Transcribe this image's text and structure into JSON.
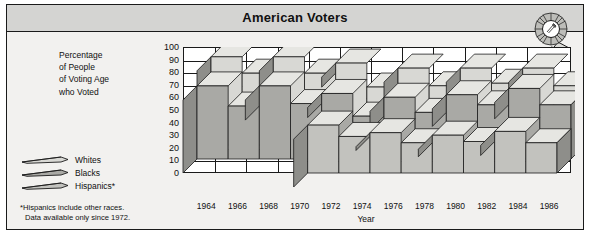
{
  "card": {
    "title": "American Voters",
    "award_icon": "award-rosette-icon"
  },
  "y_axis_caption": [
    "Percentage",
    "of People",
    "of Voting Age",
    "who Voted"
  ],
  "legend": {
    "items": [
      {
        "label": "Whites",
        "color": "#d8d8d4",
        "icon": "ribbon-swatch-icon"
      },
      {
        "label": "Blacks",
        "color": "#a9a9a5",
        "icon": "ribbon-swatch-icon"
      },
      {
        "label": "Hispanics*",
        "color": "#c2c2be",
        "icon": "ribbon-swatch-icon"
      }
    ]
  },
  "footnote": {
    "line1": "*Hispanics include other races.",
    "line2": "Data available only since 1972."
  },
  "chart_data": {
    "type": "area",
    "title": "American Voters",
    "xlabel": "Year",
    "ylabel": "Percentage of People of Voting Age who Voted",
    "categories": [
      1964,
      1966,
      1968,
      1970,
      1972,
      1974,
      1976,
      1978,
      1980,
      1982,
      1984,
      1986
    ],
    "ylim": [
      0,
      100
    ],
    "yticks": [
      0,
      10,
      20,
      30,
      40,
      50,
      60,
      70,
      80,
      90,
      100
    ],
    "grid": true,
    "legend_position": "left",
    "series": [
      {
        "name": "Whites",
        "color": "#d8d8d4",
        "values": [
          70,
          57,
          70,
          57,
          65,
          46,
          61,
          47,
          61,
          49,
          61,
          47
        ]
      },
      {
        "name": "Blacks",
        "color": "#a9a9a5",
        "values": [
          58,
          42,
          58,
          44,
          52,
          34,
          49,
          37,
          51,
          43,
          56,
          43
        ]
      },
      {
        "name": "Hispanics*",
        "color": "#c2c2be",
        "values": [
          null,
          null,
          null,
          null,
          38,
          29,
          32,
          24,
          30,
          25,
          33,
          24
        ]
      }
    ],
    "notes": "*Hispanics include other races. Data available only since 1972."
  }
}
